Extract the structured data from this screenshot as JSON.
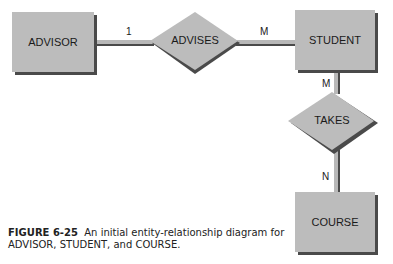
{
  "diagram": {
    "entities": [
      {
        "id": "advisor",
        "label": "ADVISOR"
      },
      {
        "id": "student",
        "label": "STUDENT"
      },
      {
        "id": "course",
        "label": "COURSE"
      }
    ],
    "relationships": [
      {
        "id": "advises",
        "label": "ADVISES"
      },
      {
        "id": "takes",
        "label": "TAKES"
      }
    ],
    "cardinalities": {
      "advisor_advises": "1",
      "advises_student": "M",
      "student_takes": "M",
      "takes_course": "N"
    }
  },
  "caption": {
    "figure_number": "FIGURE 6-25",
    "text_line1": "An initial entity-relationship diagram for",
    "text_line2": "ADVISOR, STUDENT, and COURSE."
  }
}
